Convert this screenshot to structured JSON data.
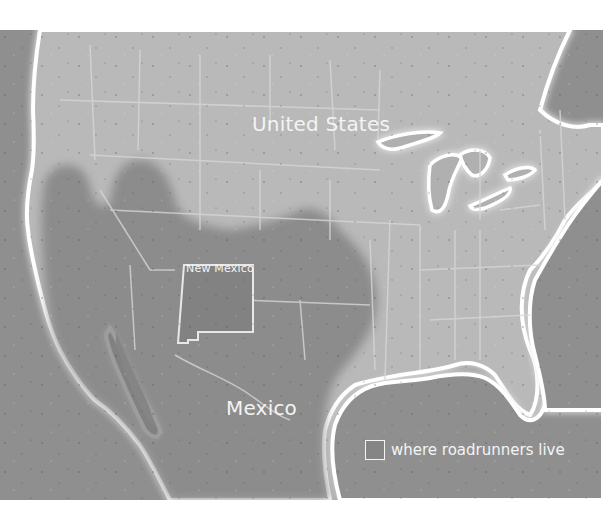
{
  "map": {
    "title": "Roadrunner range map",
    "labels": {
      "country_us": "United States",
      "state_nm": "New Mexico",
      "country_mx": "Mexico"
    },
    "legend": {
      "items": [
        {
          "label": "where roadrunners live",
          "swatch_color": "#858585",
          "icon": "range-swatch"
        }
      ]
    },
    "colors": {
      "ocean": "#8f8f8f",
      "land": "#b9b9b9",
      "range": "#8a8a8a",
      "coast_glow": "#ffffff",
      "label_text": "#f4f4f4",
      "background": "#ffffff"
    },
    "regions": [
      "United States",
      "Mexico",
      "New Mexico",
      "Great Lakes",
      "Gulf of Mexico",
      "Pacific Ocean",
      "Atlantic Ocean",
      "Baja California"
    ]
  }
}
